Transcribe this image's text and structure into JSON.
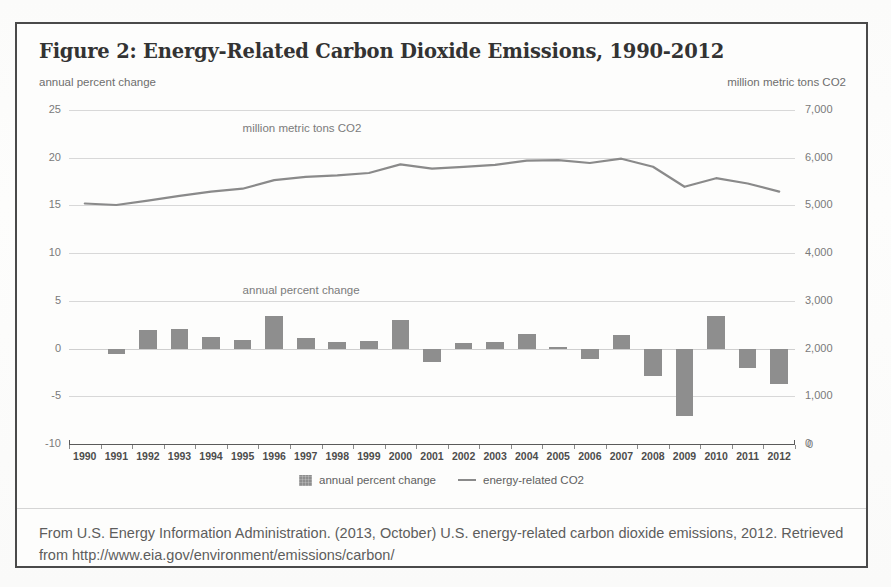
{
  "figure": {
    "title": "Figure 2: Energy-Related Carbon Dioxide Emissions, 1990-2012",
    "left_axis_caption": "annual percent change",
    "right_axis_caption": "million metric tons CO2",
    "inner_label_line": "million metric tons CO2",
    "inner_label_bars": "annual percent change",
    "caption": "From U.S. Energy Information Administration. (2013, October) U.S. energy-related carbon dioxide emissions, 2012. Retrieved from http://www.eia.gov/environment/emissions/carbon/",
    "legend": [
      {
        "label": "annual percent change",
        "marker": "swatch",
        "color": "#8e8e8e"
      },
      {
        "label": "energy-related CO2",
        "marker": "line",
        "color": "#8a8a8a"
      }
    ]
  },
  "chart_data": {
    "type": "bar",
    "title": "Figure 2: Energy-Related Carbon Dioxide Emissions, 1990-2012",
    "xlabel": "",
    "ylabel": "annual percent change",
    "y2label": "million metric tons CO2",
    "ylim": [
      -10,
      25
    ],
    "y2lim": [
      0,
      7000
    ],
    "grid": true,
    "legend_position": "bottom-center",
    "categories": [
      "1990",
      "1991",
      "1992",
      "1993",
      "1994",
      "1995",
      "1996",
      "1997",
      "1998",
      "1999",
      "2000",
      "2001",
      "2002",
      "2003",
      "2004",
      "2005",
      "2006",
      "2007",
      "2008",
      "2009",
      "2010",
      "2011",
      "2012"
    ],
    "yticks": [
      25,
      20,
      15,
      10,
      5,
      0,
      -5,
      -10
    ],
    "ytick_labels": [
      "25",
      "20",
      "15",
      "10",
      "5",
      "0",
      "-5",
      "-10"
    ],
    "y2ticks": [
      7000,
      6000,
      5000,
      4000,
      3000,
      2000,
      1000,
      0
    ],
    "y2tick_labels": [
      "7,000",
      "6,000",
      "5,000",
      "4,000",
      "3,000",
      "2,000",
      "1,000",
      "0"
    ],
    "series": [
      {
        "name": "annual percent change",
        "type": "bar",
        "axis": "left",
        "color": "#8e8e8e",
        "values": [
          null,
          -0.6,
          1.9,
          2.0,
          1.2,
          0.9,
          3.4,
          1.1,
          0.7,
          0.8,
          3.0,
          -1.4,
          0.6,
          0.7,
          1.5,
          0.2,
          -1.1,
          1.4,
          -2.9,
          -7.1,
          3.4,
          -2.0,
          -3.7
        ]
      },
      {
        "name": "energy-related CO2",
        "type": "line",
        "axis": "right",
        "color": "#8a8a8a",
        "values": [
          5040,
          5010,
          5100,
          5200,
          5290,
          5350,
          5530,
          5600,
          5630,
          5680,
          5860,
          5770,
          5810,
          5850,
          5940,
          5950,
          5890,
          5980,
          5810,
          5390,
          5570,
          5460,
          5290
        ]
      }
    ]
  }
}
